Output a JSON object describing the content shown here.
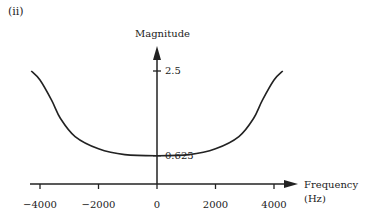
{
  "panel_label": "(ii)",
  "chart_data": {
    "type": "line",
    "title": "",
    "xlabel": "Frequency",
    "xlabel_unit": "(Hz)",
    "ylabel": "Magnitude",
    "xticks": [
      -4000,
      -2000,
      0,
      2000,
      4000
    ],
    "xtick_labels": [
      "−4000",
      "−2000",
      "0",
      "2000",
      "4000"
    ],
    "yticks": [
      0.625,
      2.5
    ],
    "ytick_labels": [
      "0.625",
      "2.5"
    ],
    "xlim": [
      -4500,
      4800
    ],
    "ylim": [
      0,
      3.2
    ],
    "grid": false,
    "series": [
      {
        "name": "Magnitude response",
        "x": [
          -4300,
          -4000,
          -3600,
          -3300,
          -2800,
          -2000,
          -1100,
          0,
          1100,
          2000,
          2800,
          3300,
          3600,
          4000,
          4300
        ],
        "y": [
          2.5,
          2.3,
          1.85,
          1.45,
          1.05,
          0.78,
          0.65,
          0.625,
          0.65,
          0.78,
          1.05,
          1.45,
          1.85,
          2.3,
          2.5
        ]
      }
    ],
    "color": "#222222"
  }
}
